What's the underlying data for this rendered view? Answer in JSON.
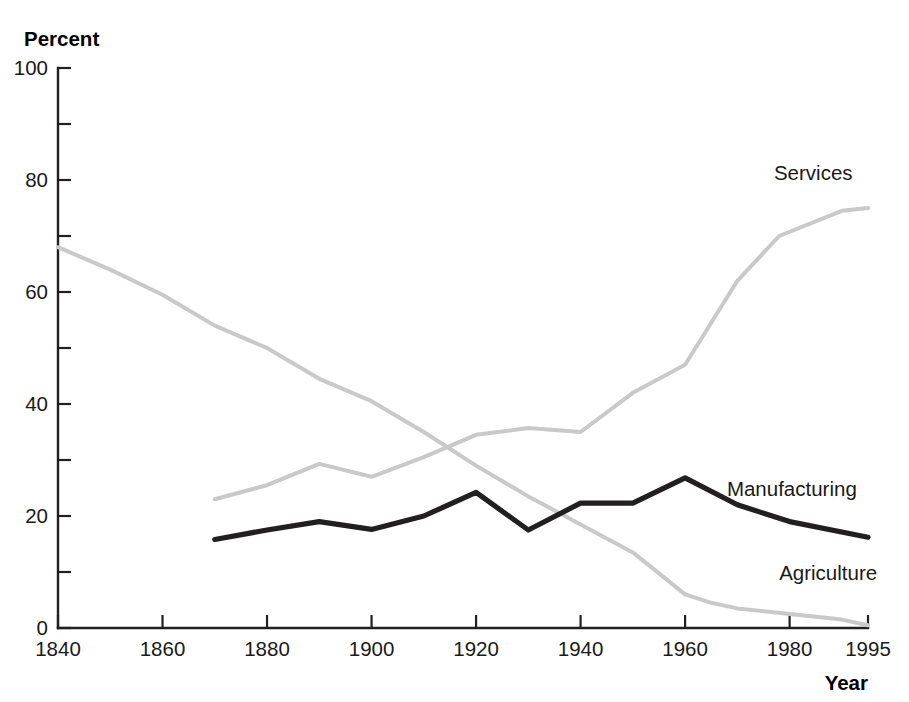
{
  "chart_data": {
    "type": "line",
    "title": "",
    "subtitle": "",
    "xlabel": "Year",
    "ylabel": "Percent",
    "xlim": [
      1840,
      1995
    ],
    "ylim": [
      0,
      100
    ],
    "grid": false,
    "legend_position": "inline-right-of-series",
    "y_ticks_major": [
      0,
      20,
      40,
      60,
      80,
      100
    ],
    "y_tick_labels": [
      "0",
      "20",
      "40",
      "60",
      "80",
      "100"
    ],
    "y_ticks_minor": [
      10,
      30,
      50,
      70,
      90
    ],
    "x_ticks": [
      1840,
      1860,
      1880,
      1900,
      1920,
      1940,
      1960,
      1980,
      1995
    ],
    "x_tick_labels": [
      "1840",
      "1860",
      "1880",
      "1900",
      "1920",
      "1940",
      "1960",
      "1980",
      "1995"
    ],
    "series": [
      {
        "name": "Agriculture",
        "color": "#c9c9c9",
        "width": 4.0,
        "label_x": 1978,
        "label_y": 8.5,
        "x": [
          1840,
          1850,
          1860,
          1870,
          1880,
          1890,
          1900,
          1910,
          1920,
          1930,
          1940,
          1950,
          1960,
          1965,
          1970,
          1980,
          1990,
          1995
        ],
        "y": [
          68,
          64,
          59.5,
          54,
          50,
          44.5,
          40.5,
          35,
          29,
          23.5,
          18.5,
          13.5,
          6,
          4.5,
          3.5,
          2.5,
          1.5,
          0.5
        ]
      },
      {
        "name": "Manufacturing",
        "color": "#231f20",
        "width": 5.2,
        "label_x": 1968,
        "label_y": 23.5,
        "x": [
          1870,
          1880,
          1890,
          1900,
          1910,
          1920,
          1930,
          1940,
          1950,
          1960,
          1970,
          1980,
          1995
        ],
        "y": [
          15.8,
          17.5,
          19,
          17.6,
          20,
          24.2,
          17.5,
          22.3,
          22.3,
          26.8,
          22,
          19,
          16.2
        ]
      },
      {
        "name": "Services",
        "color": "#c9c9c9",
        "width": 4.0,
        "label_x": 1977,
        "label_y": 80,
        "x": [
          1870,
          1880,
          1890,
          1900,
          1910,
          1920,
          1930,
          1940,
          1950,
          1960,
          1970,
          1978,
          1990,
          1995
        ],
        "y": [
          23,
          25.5,
          29.3,
          27,
          30.5,
          34.5,
          35.7,
          35,
          42,
          47,
          62,
          70,
          74.5,
          75
        ]
      }
    ]
  },
  "axes": {
    "y_axis_title": "Percent",
    "x_axis_title": "Year"
  }
}
